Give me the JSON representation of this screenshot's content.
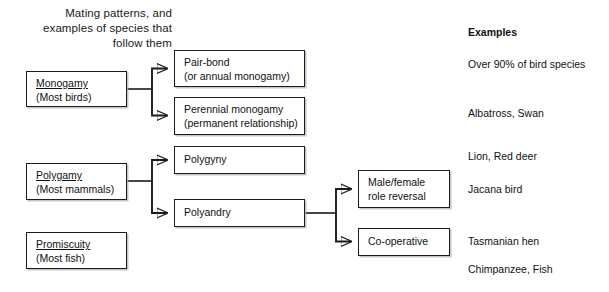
{
  "title": "Mating patterns, and\nexamples of species that\nfollow them",
  "left_column": {
    "boxes": [
      {
        "name": "monogamy",
        "label": "Monogamy",
        "sub": "(Most birds)"
      },
      {
        "name": "polygamy",
        "label": "Polygamy",
        "sub": "(Most mammals)"
      },
      {
        "name": "promiscuity",
        "label": "Promiscuity",
        "sub": "(Most fish)"
      }
    ]
  },
  "middle_column": {
    "boxes": [
      {
        "name": "pair-bond",
        "line1": "Pair-bond",
        "line2": "(or annual monogamy)"
      },
      {
        "name": "perennial-monogamy",
        "line1": "Perennial monogamy",
        "line2": "(permanent relationship)"
      },
      {
        "name": "polygyny",
        "line1": "Polygyny",
        "line2": ""
      },
      {
        "name": "polyandry",
        "line1": "Polyandry",
        "line2": ""
      }
    ]
  },
  "right_column": {
    "boxes": [
      {
        "name": "male-female-role-reversal",
        "line1": "Male/female",
        "line2": "role reversal"
      },
      {
        "name": "co-operative",
        "line1": "Co-operative",
        "line2": ""
      }
    ]
  },
  "examples": {
    "heading": "Examples",
    "items": [
      "Over 90% of bird species",
      "Albatross, Swan",
      "Lion, Red deer",
      "Jacana bird",
      "Tasmanian hen",
      "Chimpanzee, Fish"
    ]
  },
  "colors": {
    "ink": "#1b1b1b",
    "background": "#ffffff",
    "box_shadow": "#969696"
  }
}
